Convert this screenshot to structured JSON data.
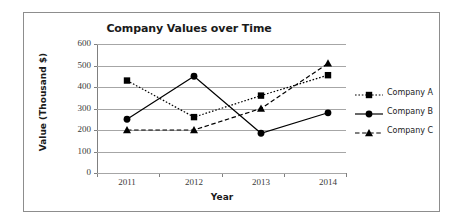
{
  "chart_data": {
    "type": "line",
    "title": "Company Values over Time",
    "xlabel": "Year",
    "ylabel": "Value (Thousand $)",
    "categories": [
      "2011",
      "2012",
      "2013",
      "2014"
    ],
    "yticks": [
      "600",
      "500",
      "400",
      "300",
      "200",
      "100",
      "0"
    ],
    "ylim": [
      0,
      600
    ],
    "ytick_step": 100,
    "grid": true,
    "legend_position": "right",
    "series": [
      {
        "name": "Company A",
        "values": [
          430,
          260,
          360,
          455
        ],
        "marker": "square",
        "linestyle": "dotted",
        "color": "#000000"
      },
      {
        "name": "Company B",
        "values": [
          250,
          450,
          185,
          280
        ],
        "marker": "circle",
        "linestyle": "solid",
        "color": "#000000"
      },
      {
        "name": "Company C",
        "values": [
          200,
          200,
          300,
          510
        ],
        "marker": "triangle",
        "linestyle": "dashed",
        "color": "#000000"
      }
    ]
  },
  "colors": {
    "gridline": "#a6a6a6",
    "axis": "#808080",
    "border": "#8d8d8d",
    "text": "#1a1a1a",
    "tick_text": "#3a3a3a"
  }
}
